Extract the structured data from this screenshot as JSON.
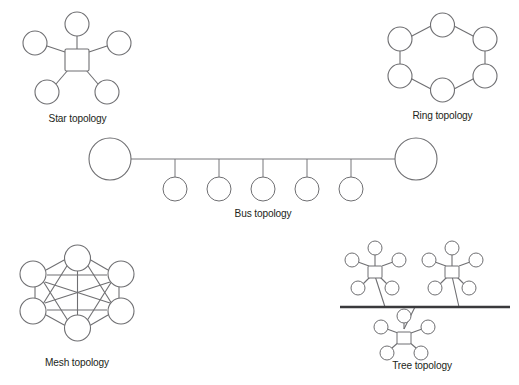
{
  "figure": {
    "background_color": "#ffffff",
    "stroke_color": "#6f6f72",
    "backbone_color": "#3a3a3c",
    "text_color": "#231f20"
  },
  "panels": [
    {
      "id": "star",
      "caption": "Star topology",
      "hub_shape": "square",
      "leaf_shape": "circle",
      "leaf_count": 5,
      "node_names": [
        "hub",
        "leaf-top",
        "leaf-left",
        "leaf-right",
        "leaf-bottom-left",
        "leaf-bottom-right"
      ]
    },
    {
      "id": "ring",
      "caption": "Ring topology",
      "node_shape": "circle",
      "node_count": 6,
      "arrangement": "hexagon",
      "closed_loop": true
    },
    {
      "id": "bus",
      "caption": "Bus topology",
      "terminator_count": 2,
      "drop_node_count": 5,
      "backbone": "horizontal-line"
    },
    {
      "id": "mesh",
      "caption": "Mesh topology",
      "node_shape": "circle",
      "node_count": 6,
      "arrangement": "hexagon",
      "edge_count": 15,
      "fully_connected": true
    },
    {
      "id": "tree",
      "caption": "Tree topology",
      "cluster_count": 3,
      "clusters_above_backbone": 2,
      "clusters_below_backbone": 1,
      "leaves_per_cluster": 5,
      "hub_shape": "square",
      "backbone": "horizontal-line"
    }
  ]
}
